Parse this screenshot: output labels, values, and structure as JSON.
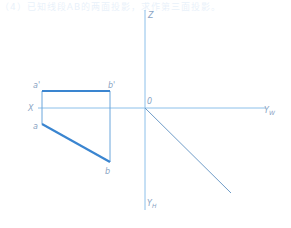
{
  "header": {
    "faded_text": "（4）已知线段AB的两面投影，求作第三面投影。"
  },
  "colors": {
    "axis": "#8cc0ea",
    "thick_line": "#3a85d0",
    "projection": "#6aa6dc",
    "label": "#8aa4c4"
  },
  "diagram": {
    "axes": {
      "z_label": "Z",
      "x_label": "X",
      "origin_label": "0",
      "yw_label": "Y",
      "yw_sub": "W",
      "yh_label": "Y",
      "yh_sub": "H"
    },
    "points": {
      "a_prime": "a'",
      "b_prime": "b'",
      "a": "a",
      "b": "b"
    }
  }
}
